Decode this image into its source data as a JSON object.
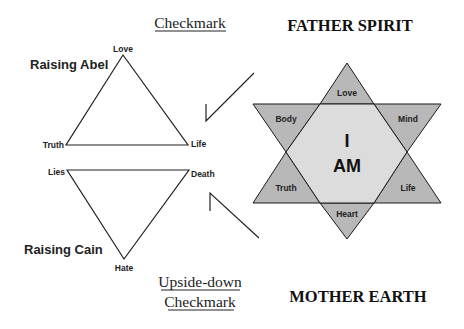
{
  "headers": {
    "checkmark": "Checkmark",
    "father_spirit": "FATHER SPIRIT",
    "upside_down_line1": "Upside-down",
    "upside_down_line2": "Checkmark",
    "mother_earth": "MOTHER EARTH"
  },
  "abel": {
    "title": "Raising Abel",
    "top": "Love",
    "left": "Truth",
    "right": "Life"
  },
  "cain": {
    "title": "Raising Cain",
    "left": "Lies",
    "right": "Death",
    "bottom": "Hate"
  },
  "star": {
    "center_line1": "I",
    "center_line2": "AM",
    "top": "Love",
    "upper_left": "Body",
    "upper_right": "Mind",
    "lower_left": "Truth",
    "lower_right": "Life",
    "bottom": "Heart",
    "colors": {
      "points": "#b8b8b8",
      "center": "#dcdcdc",
      "stroke": "#1a1a1a"
    }
  }
}
